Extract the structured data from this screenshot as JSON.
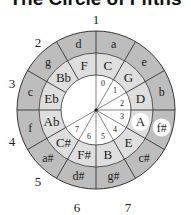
{
  "title": "The Circle of Fifths",
  "colors": {
    "outer_ring": "#bdbdbd",
    "middle_ring": "#dedede",
    "inner_circle": "#ffffff",
    "highlight": "#ffffff",
    "line": "#333333"
  },
  "geometry": {
    "cx": 96,
    "cy": 110,
    "r_outer": 79,
    "r_middle": 57,
    "r_inner": 35
  },
  "major_keys": [
    "C",
    "G",
    "D",
    "A",
    "E",
    "B",
    "F#",
    "C#",
    "Ab",
    "Eb",
    "Bb",
    "F"
  ],
  "minor_keys": [
    "a",
    "e",
    "b",
    "f#",
    "c#",
    "g#",
    "d#",
    "a#",
    "f",
    "c",
    "g",
    "d"
  ],
  "highlighted": {
    "major": "A",
    "minor": "f#"
  },
  "inner_numbers": [
    "0",
    "1",
    "2",
    "3",
    "4",
    "5",
    "6",
    "7"
  ],
  "outer_numbers": [
    {
      "label": "1",
      "x": 96,
      "y": 19
    },
    {
      "label": "2",
      "x": 38,
      "y": 42
    },
    {
      "label": "3",
      "x": 12,
      "y": 83
    },
    {
      "label": "4",
      "x": 12,
      "y": 141
    },
    {
      "label": "5",
      "x": 38,
      "y": 181
    },
    {
      "label": "6",
      "x": 77,
      "y": 207
    },
    {
      "label": "7",
      "x": 128,
      "y": 207
    }
  ]
}
